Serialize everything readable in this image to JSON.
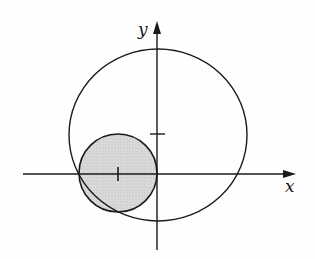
{
  "diagram": {
    "type": "geometry-plot",
    "axes": {
      "x_label": "x",
      "y_label": "y",
      "origin_px": [
        157,
        174
      ]
    },
    "curves": [
      {
        "name": "large-circle",
        "center_px": [
          158,
          135
        ],
        "radius_px": [
          89,
          86
        ],
        "fill": "none",
        "stroke": "#1a1a1a"
      },
      {
        "name": "small-circle",
        "center_px": [
          118,
          173
        ],
        "radius_px": 39,
        "fill": "#d0d0d0",
        "stroke": "#1a1a1a",
        "shaded": true
      }
    ],
    "ticks": [
      {
        "name": "center-tick-small",
        "px": [
          118,
          174
        ],
        "orientation": "vertical"
      },
      {
        "name": "center-tick-large",
        "px": [
          157,
          134
        ],
        "orientation": "horizontal"
      }
    ],
    "colors": {
      "ink": "#1a1a1a",
      "shade": "#d0d0d0",
      "background": "#fefefe"
    }
  }
}
